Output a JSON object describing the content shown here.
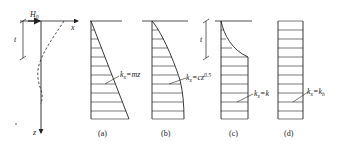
{
  "figure": {
    "ink_color": "#222222",
    "background": "#ffffff",
    "pile": {
      "force_label": "H",
      "force_subscript": "0",
      "x_axis_label": "x",
      "z_axis_label": "z",
      "depth_label": "t"
    },
    "panels": [
      {
        "id": "a",
        "caption": "(a)",
        "formula_main": "k",
        "formula_sub": "x",
        "formula_rest": "=mz",
        "profile": "linear"
      },
      {
        "id": "b",
        "caption": "(b)",
        "formula_main": "k",
        "formula_sub": "x",
        "formula_rest": "=cz",
        "formula_sup": "0.5",
        "profile": "sqrt"
      },
      {
        "id": "c",
        "caption": "(c)",
        "formula_main": "k",
        "formula_sub": "x",
        "formula_rest": "=k",
        "profile": "curve-then-constant",
        "depth_label": "t"
      },
      {
        "id": "d",
        "caption": "(d)",
        "formula_main": "k",
        "formula_sub": "x",
        "formula_rest": "=k",
        "formula_rest_sub": "h",
        "profile": "constant"
      }
    ]
  }
}
